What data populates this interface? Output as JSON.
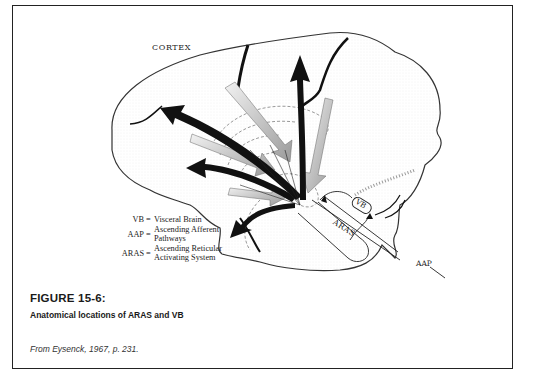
{
  "figure": {
    "number_label": "FIGURE 15-6:",
    "title": "Anatomical locations of ARAS and VB",
    "source": "From Eysenck, 1967, p. 231."
  },
  "diagram": {
    "labels": {
      "cortex": "CORTEX",
      "vb": "VB",
      "aras": "ARAS",
      "aap": "AAP"
    },
    "legend": [
      {
        "key": "VB",
        "value": "Visceral Brain"
      },
      {
        "key": "AAP",
        "value": "Ascending Afferent Pathways"
      },
      {
        "key": "ARAS",
        "value": "Ascending Reticular Activating System"
      }
    ]
  },
  "colors": {
    "ink": "#1a1a1a",
    "stipple": "#9a9a9a",
    "frame": "#222222"
  }
}
